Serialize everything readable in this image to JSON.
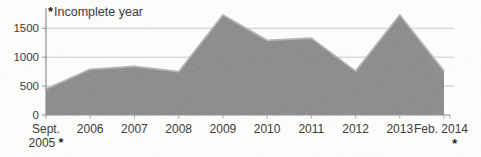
{
  "annotation": {
    "marker": "*",
    "text": "Incomplete year"
  },
  "y_axis": {
    "ticks": [
      "1500",
      "1000",
      "500",
      "0"
    ]
  },
  "x_axis": {
    "first": {
      "line1": "Sept.",
      "line2": "2005",
      "marker": "*"
    },
    "years": [
      "2006",
      "2007",
      "2008",
      "2009",
      "2010",
      "2011",
      "2012",
      "2013"
    ],
    "last": {
      "label": "Feb. 2014",
      "marker": "*"
    }
  },
  "colors": {
    "background": "#fdfdfc",
    "area_fill": "#878787",
    "area_edge": "#b0b6b3",
    "gridline": "#c9c9c9",
    "axis": "#8f8f8f",
    "tick": "#a5a5a5",
    "text": "#3b3b3b"
  },
  "chart_data": {
    "type": "area",
    "categories": [
      "Sept. 2005",
      "2006",
      "2007",
      "2008",
      "2009",
      "2010",
      "2011",
      "2012",
      "2013",
      "Feb. 2014"
    ],
    "values": [
      450,
      790,
      840,
      750,
      1730,
      1290,
      1330,
      760,
      1730,
      760
    ],
    "title": "",
    "xlabel": "",
    "ylabel": "",
    "ylim": [
      0,
      1850
    ],
    "yticks": [
      1500,
      1000,
      500,
      0
    ],
    "grid": "horizontal",
    "legend": "none",
    "annotation": "*Incomplete year",
    "incomplete_categories": [
      "Sept. 2005",
      "Feb. 2014"
    ]
  }
}
